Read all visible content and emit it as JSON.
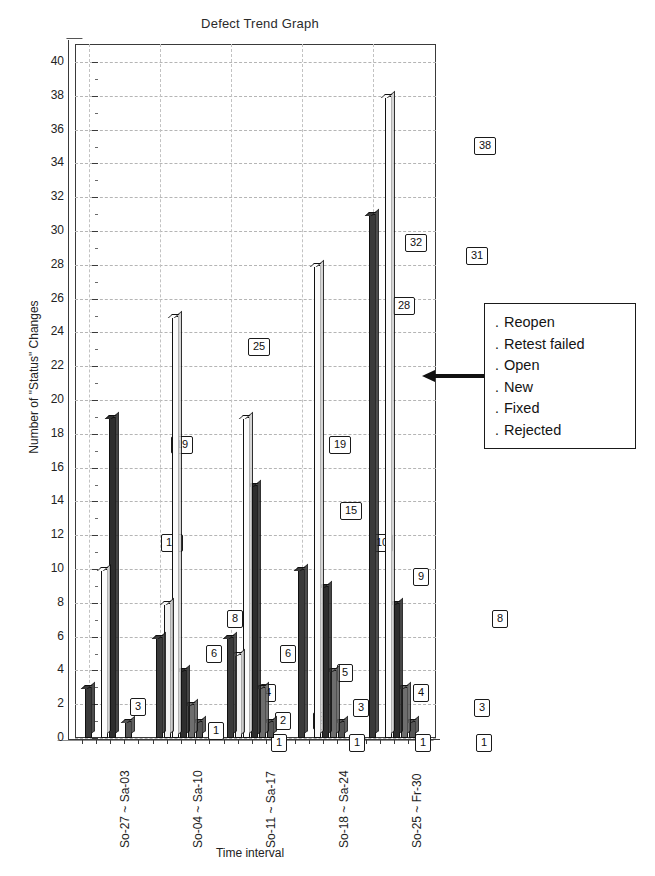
{
  "chart_data": {
    "type": "bar",
    "title": "Defect Trend Graph",
    "xlabel": "Time interval",
    "ylabel": "Number of \"Status\" Changes",
    "ylim": [
      0,
      40
    ],
    "ytick_step": 2,
    "grid": true,
    "legend_position": "right",
    "style": "3d-clustered-column-grayscale",
    "categories": [
      "So-27 ~ Sa-03",
      "So-04 ~ Sa-10",
      "So-11 ~ Sa-17",
      "So-18 ~ Sa-24",
      "So-25 ~ Fr-30"
    ],
    "series": [
      {
        "name": "Reopen",
        "values": [
          3,
          6,
          6,
          10,
          31
        ]
      },
      {
        "name": "Retest failed",
        "values": [
          0,
          8,
          5,
          0,
          0
        ]
      },
      {
        "name": "Open",
        "values": [
          10,
          25,
          19,
          28,
          38
        ]
      },
      {
        "name": "New",
        "values": [
          19,
          4,
          15,
          9,
          8
        ]
      },
      {
        "name": "Fixed",
        "values": [
          0,
          2,
          3,
          4,
          3
        ]
      },
      {
        "name": "Rejected",
        "values": [
          1,
          1,
          1,
          1,
          1
        ]
      }
    ],
    "ytick_labels": [
      "0",
      "2",
      "4",
      "6",
      "8",
      "10",
      "12",
      "14",
      "16",
      "18",
      "20",
      "22",
      "24",
      "26",
      "28",
      "30",
      "32",
      "34",
      "36",
      "38",
      "40"
    ],
    "data_labels": [
      {
        "group": 0,
        "series": "Reopen",
        "value": "3",
        "x": 55,
        "y": 654
      },
      {
        "group": 0,
        "series": "Open",
        "value": "10",
        "x": 86,
        "y": 490
      },
      {
        "group": 0,
        "series": "New",
        "value": "19",
        "x": 96,
        "y": 392
      },
      {
        "group": 0,
        "series": "Rejected",
        "value": "1",
        "x": 133,
        "y": 678
      },
      {
        "group": 1,
        "series": "Reopen",
        "value": "6",
        "x": 131,
        "y": 601
      },
      {
        "group": 1,
        "series": "Retest failed",
        "value": "8",
        "x": 152,
        "y": 566
      },
      {
        "group": 1,
        "series": "Open",
        "value": "25",
        "x": 173,
        "y": 294
      },
      {
        "group": 1,
        "series": "New",
        "value": "4",
        "x": 185,
        "y": 640
      },
      {
        "group": 1,
        "series": "Fixed",
        "value": "2",
        "x": 200,
        "y": 668
      },
      {
        "group": 1,
        "series": "Rejected",
        "value": "1",
        "x": 196,
        "y": 690
      },
      {
        "group": 2,
        "series": "Reopen",
        "value": "6",
        "x": 205,
        "y": 601
      },
      {
        "group": 2,
        "series": "Open",
        "value": "19",
        "x": 254,
        "y": 392
      },
      {
        "group": 2,
        "series": "New",
        "value": "15",
        "x": 265,
        "y": 458
      },
      {
        "group": 2,
        "series": "Retest failed",
        "value": "5",
        "x": 262,
        "y": 620
      },
      {
        "group": 2,
        "series": "Fixed",
        "value": "3",
        "x": 278,
        "y": 655
      },
      {
        "group": 2,
        "series": "Rejected",
        "value": "2",
        "x": 238,
        "y": 668
      },
      {
        "group": 2,
        "series": "Rejected2",
        "value": "1",
        "x": 274,
        "y": 690
      },
      {
        "group": 3,
        "series": "Reopen",
        "value": "10",
        "x": 296,
        "y": 490
      },
      {
        "group": 3,
        "series": "Open",
        "value": "28",
        "x": 318,
        "y": 253
      },
      {
        "group": 3,
        "series": "New",
        "value": "9",
        "x": 338,
        "y": 524
      },
      {
        "group": 3,
        "series": "Fixed",
        "value": "4",
        "x": 338,
        "y": 640
      },
      {
        "group": 3,
        "series": "Rejected",
        "value": "1",
        "x": 340,
        "y": 690
      },
      {
        "group": 3,
        "series": "Open2",
        "value": "32",
        "x": 330,
        "y": 190
      },
      {
        "group": 4,
        "series": "Reopen",
        "value": "31",
        "x": 391,
        "y": 203
      },
      {
        "group": 4,
        "series": "Open",
        "value": "38",
        "x": 399,
        "y": 93
      },
      {
        "group": 4,
        "series": "New",
        "value": "8",
        "x": 417,
        "y": 566
      },
      {
        "group": 4,
        "series": "Fixed",
        "value": "3",
        "x": 399,
        "y": 655
      },
      {
        "group": 4,
        "series": "Rejected",
        "value": "1",
        "x": 401,
        "y": 690
      }
    ]
  },
  "legend": {
    "bullet": ".",
    "items": [
      {
        "label": "Reopen"
      },
      {
        "label": "Retest failed"
      },
      {
        "label": "Open"
      },
      {
        "label": "New"
      },
      {
        "label": "Fixed"
      },
      {
        "label": "Rejected"
      }
    ]
  },
  "colors": {
    "reopen": "#3a3a3a",
    "retest_failed": "#f2f2f2",
    "open": "#fbfbfb",
    "new": "#2e2e2e",
    "fixed": "#6e6e6e",
    "rejected": "#555555",
    "axis": "#3a3a3a",
    "grid": "#b5b5b5",
    "text": "#1a1a1a"
  }
}
